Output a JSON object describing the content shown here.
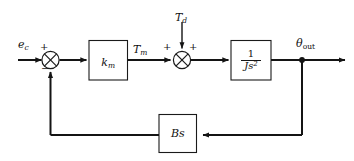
{
  "diagram": {
    "type": "control-system-block-diagram",
    "background_color": "#ffffff",
    "line_color": "#141414",
    "nodes": {
      "input_signal": {
        "label_main": "e",
        "label_sub": "c",
        "role": "reference-input"
      },
      "disturbance_input": {
        "label_main": "T",
        "label_sub": "d",
        "role": "disturbance-torque-input"
      },
      "motor_torque": {
        "label_main": "T",
        "label_sub": "m",
        "role": "intermediate-signal"
      },
      "output_signal": {
        "label_main": "θ",
        "label_sub": "out",
        "role": "output"
      }
    },
    "blocks": [
      {
        "id": "gain-block",
        "label_main": "k",
        "label_sub": "m",
        "kind": "gain"
      },
      {
        "id": "plant-block",
        "numerator": "1",
        "denominator_main": "Js",
        "denominator_exp": "2",
        "kind": "transfer-function"
      },
      {
        "id": "feedback-block",
        "label": "Bs",
        "kind": "feedback-gain"
      }
    ],
    "summing_junctions": [
      {
        "id": "error-junction",
        "signs": {
          "top_left": "+",
          "bottom": "−"
        }
      },
      {
        "id": "torque-junction",
        "signs": {
          "left": "+",
          "top_right": "+"
        }
      }
    ]
  }
}
